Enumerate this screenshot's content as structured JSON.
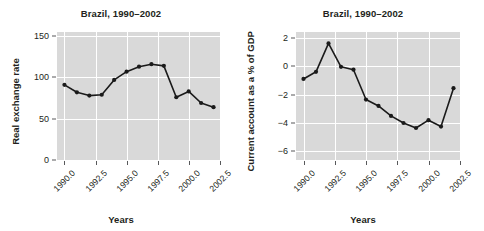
{
  "figure": {
    "width": 484,
    "height": 231,
    "background": "#ffffff",
    "panel_background": "#d9d9d9",
    "grid_color": "#ffffff",
    "line_color": "#1a1a1a",
    "marker_color": "#1a1a1a"
  },
  "chart_data": [
    {
      "type": "line",
      "panel": "left",
      "title": "Brazil, 1990–2002",
      "xlabel": "Years",
      "ylabel": "Real exchange rate",
      "x": [
        1990,
        1991,
        1992,
        1993,
        1994,
        1995,
        1996,
        1997,
        1998,
        1999,
        2000,
        2001,
        2002
      ],
      "values": [
        91,
        82,
        78,
        79,
        97,
        107,
        113,
        116,
        114,
        76,
        83,
        69,
        64
      ],
      "xlim": [
        1989.4,
        2002.6
      ],
      "ylim": [
        0,
        155
      ],
      "yticks": [
        0,
        50,
        100,
        150
      ],
      "ytick_labels": [
        "0",
        "50",
        "100",
        "150"
      ],
      "xticks": [
        1990.0,
        1992.5,
        1995.0,
        1997.5,
        2000.0,
        2002.5
      ],
      "xtick_labels": [
        "1990.0",
        "1992.5",
        "1995.0",
        "1997.5",
        "2000.0",
        "2002.5"
      ],
      "grid": true,
      "legend": "none",
      "marker": "circle"
    },
    {
      "type": "line",
      "panel": "right",
      "title": "Brazil, 1990–2002",
      "xlabel": "Years",
      "ylabel": "Current account as a % of GDP",
      "x": [
        1990,
        1991,
        1992,
        1993,
        1994,
        1995,
        1996,
        1997,
        1998,
        1999,
        2000,
        2001,
        2002
      ],
      "values": [
        -0.9,
        -0.4,
        1.6,
        -0.05,
        -0.25,
        -2.35,
        -2.8,
        -3.5,
        -4.0,
        -4.35,
        -3.8,
        -4.25,
        -1.55
      ],
      "xlim": [
        1989.4,
        2002.6
      ],
      "ylim": [
        -6.6,
        2.4
      ],
      "yticks": [
        2,
        0,
        -2,
        -4,
        -6
      ],
      "ytick_labels": [
        "2",
        "0",
        "−2",
        "−4",
        "−6"
      ],
      "xticks": [
        1990.0,
        1992.5,
        1995.0,
        1997.5,
        2000.0,
        2002.5
      ],
      "xtick_labels": [
        "1990.0",
        "1992.5",
        "1995.0",
        "1997.5",
        "2000.0",
        "2002.5"
      ],
      "grid": true,
      "legend": "none",
      "marker": "circle"
    }
  ]
}
